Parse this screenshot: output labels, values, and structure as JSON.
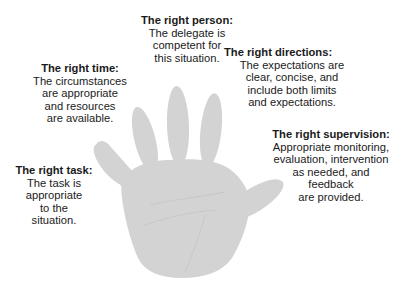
{
  "colors": {
    "hand_fill": "#d3d3d3",
    "text": "#1a1a1a",
    "background": "#ffffff"
  },
  "callouts": {
    "person": {
      "title": "The right person:",
      "lines": [
        "The delegate is",
        "competent for",
        "this situation."
      ]
    },
    "time": {
      "title": "The right time:",
      "lines": [
        "The circumstances",
        "are appropriate",
        "and resources",
        "are available."
      ]
    },
    "directions": {
      "title": "The right directions:",
      "lines": [
        "The expectations are",
        "clear, concise, and",
        "include both limits",
        "and expectations."
      ]
    },
    "task": {
      "title": "The right task:",
      "lines": [
        "The task is",
        "appropriate",
        "to the",
        "situation."
      ]
    },
    "supervision": {
      "title": "The right supervision:",
      "lines": [
        "Appropriate monitoring,",
        "evaluation, intervention",
        "as needed, and",
        "feedback",
        "are provided."
      ]
    }
  },
  "figure": {
    "icon": "open-hand-palm"
  }
}
